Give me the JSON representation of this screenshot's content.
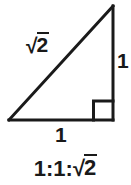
{
  "figure": {
    "name": "right-isosceles-triangle",
    "background_color": "#ffffff",
    "stroke_color": "#1a1a1a",
    "text_color": "#1a1a1a",
    "stroke_width": 3
  },
  "labels": {
    "hypotenuse": {
      "radical_sign": "√",
      "radicand": "2",
      "full_text": "√2"
    },
    "leg_vertical": "1",
    "leg_horizontal": "1"
  },
  "caption": {
    "prefix": "1:1:",
    "radical_sign": "√",
    "radicand": "2",
    "full_text": "1:1:√2"
  },
  "geometry": {
    "vertices": {
      "apex_top_right": [
        113,
        6
      ],
      "corner_bottom_right": [
        113,
        120
      ],
      "corner_bottom_left": [
        9,
        120
      ]
    },
    "right_angle_marker": {
      "at_vertex": "corner_bottom_right",
      "size": 19
    }
  }
}
